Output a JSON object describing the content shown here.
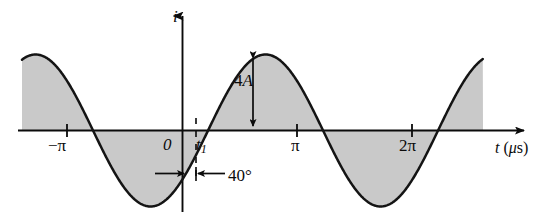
{
  "figure": {
    "title": "",
    "axes": {
      "y_axis_label": "i",
      "x_axis_label": "t (μs)"
    },
    "labels": {
      "origin": "0",
      "t1": "t",
      "t1_sub": "1",
      "neg_pi": "−π",
      "pi": "π",
      "two_pi": "2π",
      "amplitude": "4A",
      "phase": "40°"
    },
    "colors": {
      "curve": "#141414",
      "fill": "#c9c9c9",
      "axis": "#0b0b0b",
      "background": "#ffffff"
    }
  },
  "chart_data": {
    "type": "line",
    "title": "",
    "xlabel": "t (μs)",
    "ylabel": "i",
    "grid": false,
    "legend": null,
    "function": "i = 4A sin(t − 40°)",
    "amplitude": 4,
    "amplitude_label": "4A",
    "phase_shift_degrees": 40,
    "period_label": "2π",
    "xtick_values": [
      -3.1416,
      0,
      3.1416,
      6.2832
    ],
    "xtick_labels": [
      "−π",
      "0",
      "π",
      "2π"
    ],
    "annotations": [
      {
        "name": "amplitude-arrow",
        "text": "4A",
        "from": [
          1.93,
          4
        ],
        "to": [
          1.93,
          0
        ]
      },
      {
        "name": "phase-arrow",
        "text": "40°",
        "from": [
          0.698,
          -1.6
        ],
        "to": [
          0,
          -1.6
        ]
      },
      {
        "name": "t1-marker",
        "text": "t₁",
        "x": 0.698,
        "y": 0
      }
    ],
    "xlim": [
      -4.4,
      9.5
    ],
    "ylim": [
      -4.6,
      4.6
    ],
    "shaded_region": "area between curve and t-axis",
    "x": [
      -4.4,
      -4.2,
      -4.0,
      -3.8,
      -3.6,
      -3.4,
      -3.2,
      -3.0,
      -2.8,
      -2.6,
      -2.4,
      -2.2,
      -2.0,
      -1.8,
      -1.6,
      -1.4,
      -1.2,
      -1.0,
      -0.8,
      -0.6,
      -0.4,
      -0.2,
      0.0,
      0.2,
      0.4,
      0.6,
      0.8,
      1.0,
      1.2,
      1.4,
      1.6,
      1.8,
      2.0,
      2.2,
      2.4,
      2.6,
      2.8,
      3.0,
      3.2,
      3.4,
      3.6,
      3.8,
      4.0,
      4.2,
      4.4,
      4.6,
      4.8,
      5.0,
      5.2,
      5.4,
      5.6,
      5.8,
      6.0,
      6.2,
      6.4,
      6.6,
      6.8,
      7.0,
      7.2,
      7.4,
      7.6,
      7.8,
      8.0,
      8.2,
      8.4,
      8.6,
      8.8,
      9.0,
      9.2
    ],
    "y": [
      3.99,
      3.85,
      3.56,
      3.12,
      2.56,
      1.9,
      1.17,
      0.4,
      -0.39,
      -1.16,
      -1.89,
      -2.55,
      -3.12,
      -3.56,
      -3.86,
      -3.99,
      -3.96,
      -3.76,
      -3.4,
      -2.91,
      -2.3,
      -1.6,
      -0.85,
      -0.07,
      0.72,
      1.47,
      2.18,
      2.8,
      3.32,
      3.7,
      3.93,
      4.0,
      3.9,
      3.64,
      3.23,
      2.7,
      2.06,
      1.33,
      0.56,
      -0.23,
      -1.01,
      -1.75,
      -2.43,
      -3.01,
      -3.48,
      -3.82,
      -3.98,
      -3.99,
      -3.83,
      -3.51,
      -3.05,
      -2.47,
      -1.8,
      -1.08,
      -0.31,
      0.48,
      1.25,
      1.98,
      2.63,
      3.18,
      3.6,
      3.88,
      4.0,
      3.95,
      3.74,
      3.37,
      2.87,
      2.26,
      1.56
    ]
  }
}
